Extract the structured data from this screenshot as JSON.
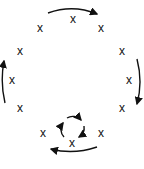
{
  "diagram": {
    "marks": [
      {
        "label": "x",
        "x": 73,
        "y": 19
      },
      {
        "label": "x",
        "x": 40,
        "y": 28
      },
      {
        "label": "x",
        "x": 101,
        "y": 28
      },
      {
        "label": "x",
        "x": 20,
        "y": 51
      },
      {
        "label": "x",
        "x": 122,
        "y": 51
      },
      {
        "label": "x",
        "x": 12,
        "y": 80
      },
      {
        "label": "x",
        "x": 129,
        "y": 80
      },
      {
        "label": "x",
        "x": 20,
        "y": 108
      },
      {
        "label": "x",
        "x": 122,
        "y": 108
      },
      {
        "label": "x",
        "x": 43,
        "y": 133
      },
      {
        "label": "x",
        "x": 101,
        "y": 133
      },
      {
        "label": "x",
        "x": 72,
        "y": 143
      }
    ],
    "arrows": [
      {
        "name": "top-arrow",
        "direction": "clockwise"
      },
      {
        "name": "right-arrow",
        "direction": "clockwise"
      },
      {
        "name": "bottom-arrow",
        "direction": "clockwise"
      },
      {
        "name": "left-arrow",
        "direction": "clockwise"
      },
      {
        "name": "center-loop",
        "direction": "clockwise"
      }
    ],
    "caption": ""
  }
}
